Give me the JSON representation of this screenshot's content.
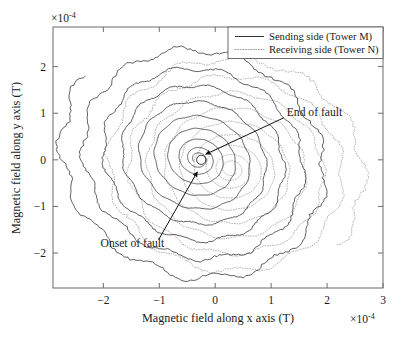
{
  "chart_data": {
    "type": "line",
    "title": "",
    "xlabel": "Magnetic field along x axis (T)",
    "ylabel": "Magnetic field along y axis (T)",
    "x_exponent": "×10⁻⁴",
    "y_exponent": "×10⁻⁴",
    "x_multiplier_text": "×10",
    "x_multiplier_sup": "-4",
    "y_multiplier_text": "×10",
    "y_multiplier_sup": "-4",
    "xlim": [
      -2.9,
      3.0
    ],
    "ylim": [
      -2.75,
      2.85
    ],
    "xticks": [
      -2,
      -1,
      0,
      1,
      2,
      3
    ],
    "xtick_labels": [
      "−2",
      "−1",
      "0",
      "1",
      "2",
      "3"
    ],
    "yticks": [
      -2,
      -1,
      0,
      1,
      2
    ],
    "ytick_labels": [
      "−2",
      "−1",
      "0",
      "1",
      "2"
    ],
    "grid": false,
    "legend_position": "top-right",
    "series": [
      {
        "name": "Sending side (Tower M)",
        "style": "solid",
        "color": "#2b2b2b",
        "description": "Decaying spiral trajectory centred near origin, extending up-left to approximately (-1.6, 2.7), with serrated high-frequency ripple on the outer turns."
      },
      {
        "name": "Receiving side (Tower N)",
        "style": "dotted",
        "color": "#8a8a8a",
        "description": "Decaying spiral trajectory centred near origin, extending down-right to approximately (1.6, -2.6), with serrated high-frequency ripple on the outer turns."
      }
    ],
    "annotations": [
      {
        "text": "End of fault",
        "label_x": 1.28,
        "label_y": 1.03,
        "target_x": -0.17,
        "target_y": 0.12
      },
      {
        "text": "Onset of fault",
        "label_x": -2.05,
        "label_y": -1.78,
        "target_x": -0.32,
        "target_y": -0.26
      }
    ],
    "marker": {
      "name": "convergence-point",
      "x": -0.25,
      "y": 0.0,
      "shape": "circle"
    }
  },
  "legend": {
    "items": [
      {
        "label": "Sending side (Tower M)",
        "style": "solid"
      },
      {
        "label": "Receiving side (Tower N)",
        "style": "dotted"
      }
    ]
  },
  "annotations": {
    "end_of_fault": "End of fault",
    "onset_of_fault": "Onset of fault"
  },
  "axes": {
    "x_title": "Magnetic field along x axis (T)",
    "y_title": "Magnetic field along y axis (T)",
    "x_exp_base": "×10",
    "x_exp_sup": "-4",
    "y_exp_base": "×10",
    "y_exp_sup": "-4",
    "xtick_labels": [
      "−2",
      "−1",
      "0",
      "1",
      "2",
      "3"
    ],
    "ytick_labels": [
      "2",
      "1",
      "0",
      "−1",
      "−2"
    ]
  },
  "colors": {
    "axis": "#6b6b6b",
    "sending": "#2b2b2b",
    "receiving": "#9a9a9a",
    "text": "#1a1a1a",
    "background": "#ffffff"
  }
}
